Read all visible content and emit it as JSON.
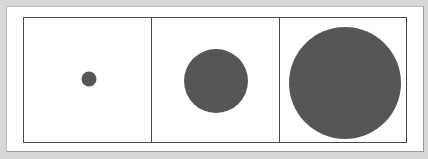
{
  "figure": {
    "background": "#ffffff",
    "frame_color": "#4a4a4a",
    "panels": [
      {
        "width": 128,
        "shape": "circle",
        "fill": "#565656",
        "diameter": 15,
        "center_x": 65,
        "center_y": 61
      },
      {
        "width": 128,
        "shape": "circle",
        "fill": "#565656",
        "diameter": 64,
        "center_x": 64,
        "center_y": 63
      },
      {
        "width": 128,
        "shape": "circle",
        "fill": "#565656",
        "diameter": 112,
        "center_x": 65,
        "center_y": 65
      }
    ]
  }
}
